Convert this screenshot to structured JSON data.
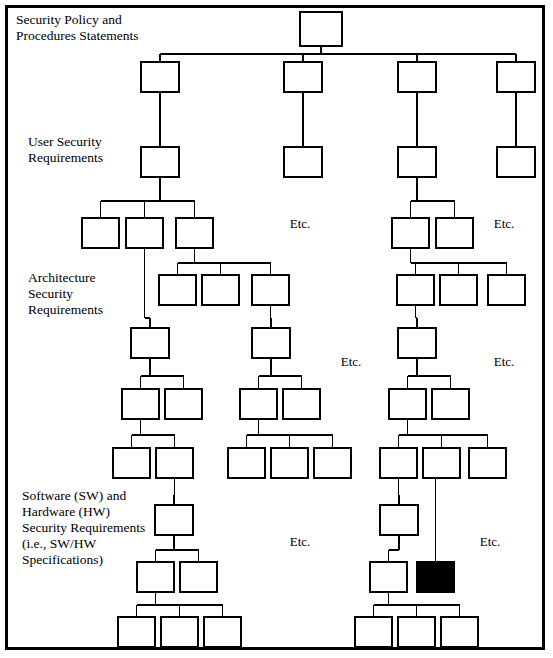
{
  "figure": {
    "type": "hierarchy-tree-diagram",
    "canvas": {
      "width": 553,
      "height": 658
    },
    "border_color": "#000000",
    "background_color": "#ffffff",
    "node_fill": "#ffffff",
    "node_stroke": "#000000",
    "highlight_fill": "#000000",
    "line_color": "#000000"
  },
  "tier_labels": [
    {
      "id": "tier-policy",
      "text": "Security Policy and\nProcedures Statements",
      "x": 16,
      "y": 12
    },
    {
      "id": "tier-user",
      "text": "User Security\nRequirements",
      "x": 28,
      "y": 134
    },
    {
      "id": "tier-architecture",
      "text": "Architecture\nSecurity\nRequirements",
      "x": 28,
      "y": 270
    },
    {
      "id": "tier-software",
      "text": "Software (SW) and\nHardware (HW)\nSecurity Requirements\n(i.e., SW/HW\nSpecifications)",
      "x": 22,
      "y": 488
    }
  ],
  "etc_labels": [
    {
      "id": "etc-1",
      "text": "Etc.",
      "x": 300,
      "y": 216
    },
    {
      "id": "etc-2",
      "text": "Etc.",
      "x": 504,
      "y": 216
    },
    {
      "id": "etc-3",
      "text": "Etc.",
      "x": 351,
      "y": 354
    },
    {
      "id": "etc-4",
      "text": "Etc.",
      "x": 504,
      "y": 354
    },
    {
      "id": "etc-5",
      "text": "Etc.",
      "x": 300,
      "y": 534
    },
    {
      "id": "etc-6",
      "text": "Etc.",
      "x": 490,
      "y": 534
    }
  ],
  "nodes": [
    {
      "id": "root",
      "x": 300,
      "y": 12,
      "w": 42,
      "h": 34,
      "filled": false
    },
    {
      "id": "b1-l2",
      "x": 141,
      "y": 62,
      "w": 38,
      "h": 30,
      "filled": false
    },
    {
      "id": "b2-l2",
      "x": 284,
      "y": 62,
      "w": 38,
      "h": 30,
      "filled": false
    },
    {
      "id": "b3-l2",
      "x": 398,
      "y": 62,
      "w": 38,
      "h": 30,
      "filled": false
    },
    {
      "id": "b4-l2",
      "x": 497,
      "y": 62,
      "w": 38,
      "h": 30,
      "filled": false
    },
    {
      "id": "b1-l3",
      "x": 141,
      "y": 147,
      "w": 38,
      "h": 30,
      "filled": false
    },
    {
      "id": "b2-l3",
      "x": 284,
      "y": 147,
      "w": 38,
      "h": 30,
      "filled": false
    },
    {
      "id": "b3-l3",
      "x": 398,
      "y": 147,
      "w": 38,
      "h": 30,
      "filled": false
    },
    {
      "id": "b4-l3",
      "x": 497,
      "y": 147,
      "w": 38,
      "h": 30,
      "filled": false
    },
    {
      "id": "b1-l4-a",
      "x": 82,
      "y": 218,
      "w": 37,
      "h": 30,
      "filled": false
    },
    {
      "id": "b1-l4-b",
      "x": 126,
      "y": 218,
      "w": 37,
      "h": 30,
      "filled": false
    },
    {
      "id": "b1-l4-c",
      "x": 176,
      "y": 218,
      "w": 37,
      "h": 30,
      "filled": false
    },
    {
      "id": "b3-l4-a",
      "x": 392,
      "y": 218,
      "w": 37,
      "h": 30,
      "filled": false
    },
    {
      "id": "b3-l4-b",
      "x": 436,
      "y": 218,
      "w": 37,
      "h": 30,
      "filled": false
    },
    {
      "id": "b1-l5-a",
      "x": 159,
      "y": 275,
      "w": 37,
      "h": 30,
      "filled": false
    },
    {
      "id": "b1-l5-b",
      "x": 202,
      "y": 275,
      "w": 37,
      "h": 30,
      "filled": false
    },
    {
      "id": "b1-l5-c",
      "x": 252,
      "y": 275,
      "w": 37,
      "h": 30,
      "filled": false
    },
    {
      "id": "b3-l5-a",
      "x": 397,
      "y": 275,
      "w": 37,
      "h": 30,
      "filled": false
    },
    {
      "id": "b3-l5-b",
      "x": 440,
      "y": 275,
      "w": 37,
      "h": 30,
      "filled": false
    },
    {
      "id": "b3-l5-c",
      "x": 488,
      "y": 275,
      "w": 37,
      "h": 30,
      "filled": false
    },
    {
      "id": "c1-l6",
      "x": 131,
      "y": 328,
      "w": 38,
      "h": 30,
      "filled": false
    },
    {
      "id": "c2-l6",
      "x": 252,
      "y": 328,
      "w": 38,
      "h": 30,
      "filled": false
    },
    {
      "id": "c3-l6",
      "x": 398,
      "y": 328,
      "w": 38,
      "h": 30,
      "filled": false
    },
    {
      "id": "c1-l7-a",
      "x": 122,
      "y": 389,
      "w": 37,
      "h": 30,
      "filled": false
    },
    {
      "id": "c1-l7-b",
      "x": 165,
      "y": 389,
      "w": 37,
      "h": 30,
      "filled": false
    },
    {
      "id": "c2-l7-a",
      "x": 240,
      "y": 389,
      "w": 37,
      "h": 30,
      "filled": false
    },
    {
      "id": "c2-l7-b",
      "x": 283,
      "y": 389,
      "w": 37,
      "h": 30,
      "filled": false
    },
    {
      "id": "c3-l7-a",
      "x": 389,
      "y": 389,
      "w": 37,
      "h": 30,
      "filled": false
    },
    {
      "id": "c3-l7-b",
      "x": 432,
      "y": 389,
      "w": 37,
      "h": 30,
      "filled": false
    },
    {
      "id": "c1-l8-a",
      "x": 113,
      "y": 448,
      "w": 37,
      "h": 30,
      "filled": false
    },
    {
      "id": "c1-l8-b",
      "x": 156,
      "y": 448,
      "w": 37,
      "h": 30,
      "filled": false
    },
    {
      "id": "c2-l8-a",
      "x": 228,
      "y": 448,
      "w": 37,
      "h": 30,
      "filled": false
    },
    {
      "id": "c2-l8-b",
      "x": 271,
      "y": 448,
      "w": 37,
      "h": 30,
      "filled": false
    },
    {
      "id": "c2-l8-c",
      "x": 314,
      "y": 448,
      "w": 37,
      "h": 30,
      "filled": false
    },
    {
      "id": "c3-l8-a",
      "x": 380,
      "y": 448,
      "w": 37,
      "h": 30,
      "filled": false
    },
    {
      "id": "c3-l8-b",
      "x": 423,
      "y": 448,
      "w": 37,
      "h": 30,
      "filled": false
    },
    {
      "id": "c3-l8-c",
      "x": 469,
      "y": 448,
      "w": 37,
      "h": 30,
      "filled": false
    },
    {
      "id": "d1-l9",
      "x": 155,
      "y": 505,
      "w": 38,
      "h": 30,
      "filled": false
    },
    {
      "id": "d3-l9",
      "x": 380,
      "y": 505,
      "w": 38,
      "h": 30,
      "filled": false
    },
    {
      "id": "d1-l10-a",
      "x": 137,
      "y": 562,
      "w": 37,
      "h": 30,
      "filled": false
    },
    {
      "id": "d1-l10-b",
      "x": 180,
      "y": 562,
      "w": 37,
      "h": 30,
      "filled": false
    },
    {
      "id": "d3-l10-a",
      "x": 370,
      "y": 562,
      "w": 37,
      "h": 30,
      "filled": false
    },
    {
      "id": "d3-l10-black",
      "x": 417,
      "y": 562,
      "w": 37,
      "h": 30,
      "filled": true
    },
    {
      "id": "d1-l11-a",
      "x": 118,
      "y": 617,
      "w": 37,
      "h": 30,
      "filled": false
    },
    {
      "id": "d1-l11-b",
      "x": 161,
      "y": 617,
      "w": 37,
      "h": 30,
      "filled": false
    },
    {
      "id": "d1-l11-c",
      "x": 204,
      "y": 617,
      "w": 37,
      "h": 30,
      "filled": false
    },
    {
      "id": "d3-l11-a",
      "x": 355,
      "y": 617,
      "w": 37,
      "h": 30,
      "filled": false
    },
    {
      "id": "d3-l11-b",
      "x": 398,
      "y": 617,
      "w": 37,
      "h": 30,
      "filled": false
    },
    {
      "id": "d3-l11-c",
      "x": 441,
      "y": 617,
      "w": 37,
      "h": 30,
      "filled": false
    }
  ],
  "edges": [
    {
      "from": "root",
      "to": [
        "b1-l2",
        "b2-l2",
        "b3-l2",
        "b4-l2"
      ],
      "bus_y": 54
    },
    {
      "from": "b1-l2",
      "to": [
        "b1-l3"
      ],
      "bus_y": 120
    },
    {
      "from": "b2-l2",
      "to": [
        "b2-l3"
      ],
      "bus_y": 120
    },
    {
      "from": "b3-l2",
      "to": [
        "b3-l3"
      ],
      "bus_y": 120
    },
    {
      "from": "b4-l2",
      "to": [
        "b4-l3"
      ],
      "bus_y": 120
    },
    {
      "from": "b1-l3",
      "to": [
        "b1-l4-a",
        "b1-l4-b",
        "b1-l4-c"
      ],
      "bus_y": 201
    },
    {
      "from": "b3-l3",
      "to": [
        "b3-l4-a",
        "b3-l4-b"
      ],
      "bus_y": 201
    },
    {
      "from": "b1-l4-c",
      "to": [
        "b1-l5-a",
        "b1-l5-b",
        "b1-l5-c"
      ],
      "bus_y": 263
    },
    {
      "from": "b3-l4-a",
      "to": [
        "b3-l5-a",
        "b3-l5-b",
        "b3-l5-c"
      ],
      "bus_y": 263
    },
    {
      "from": "b1-l4-b",
      "to": [
        "c1-l6"
      ],
      "bus_y": 318
    },
    {
      "from": "b1-l5-c",
      "to": [
        "c2-l6"
      ],
      "bus_y": 318
    },
    {
      "from": "b3-l5-a",
      "to": [
        "c3-l6"
      ],
      "bus_y": 318
    },
    {
      "from": "c1-l6",
      "to": [
        "c1-l7-a",
        "c1-l7-b"
      ],
      "bus_y": 376
    },
    {
      "from": "c2-l6",
      "to": [
        "c2-l7-a",
        "c2-l7-b"
      ],
      "bus_y": 376
    },
    {
      "from": "c3-l6",
      "to": [
        "c3-l7-a",
        "c3-l7-b"
      ],
      "bus_y": 376
    },
    {
      "from": "c1-l7-a",
      "to": [
        "c1-l8-a",
        "c1-l8-b"
      ],
      "bus_y": 435
    },
    {
      "from": "c2-l7-a",
      "to": [
        "c2-l8-a",
        "c2-l8-b",
        "c2-l8-c"
      ],
      "bus_y": 435
    },
    {
      "from": "c3-l7-a",
      "to": [
        "c3-l8-a",
        "c3-l8-b",
        "c3-l8-c"
      ],
      "bus_y": 435
    },
    {
      "from": "c1-l8-b",
      "to": [
        "d1-l9"
      ],
      "bus_y": 495
    },
    {
      "from": "c3-l8-a",
      "to": [
        "d3-l9"
      ],
      "bus_y": 495
    },
    {
      "from": "d1-l9",
      "to": [
        "d1-l10-a",
        "d1-l10-b"
      ],
      "bus_y": 550
    },
    {
      "from": "d3-l9",
      "to": [
        "d3-l10-a"
      ],
      "bus_y": 550
    },
    {
      "from": "d1-l10-a",
      "to": [
        "d1-l11-a",
        "d1-l11-b",
        "d1-l11-c"
      ],
      "bus_y": 605
    },
    {
      "from": "d3-l10-a",
      "to": [
        "d3-l11-a",
        "d3-l11-b",
        "d3-l11-c"
      ],
      "bus_y": 605
    }
  ],
  "long_edges": [
    {
      "id": "highlight-trace",
      "from": "c3-l8-b",
      "to": "d3-l10-black",
      "note": "long vertical connector to filled black node"
    }
  ]
}
